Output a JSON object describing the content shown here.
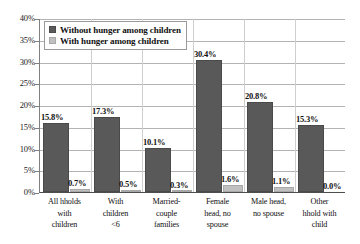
{
  "chart_data": {
    "type": "bar",
    "title": "",
    "subtitle": "",
    "xlabel": "",
    "ylabel": "",
    "ylim": [
      0,
      40
    ],
    "ytick_labels": [
      "0%",
      "5%",
      "10%",
      "15%",
      "20%",
      "25%",
      "30%",
      "35%",
      "40%"
    ],
    "ytick_values": [
      0,
      5,
      10,
      15,
      20,
      25,
      30,
      35,
      40
    ],
    "grid": "horizontal",
    "legend_position": "top-left",
    "categories": [
      "All hholds\nwith\nchildren",
      "With\nchildren\n<6",
      "Married-\ncouple\nfamilies",
      "Female\nhead, no\nspouse",
      "Male head,\nno spouse",
      "Other\nhhold with\nchild"
    ],
    "series": [
      {
        "name": "Without hunger among children",
        "color": "#595959",
        "values": [
          15.8,
          17.3,
          10.1,
          30.4,
          20.8,
          15.3
        ],
        "labels": [
          "15.8%",
          "17.3%",
          "10.1%",
          "30.4%",
          "20.8%",
          "15.3%"
        ]
      },
      {
        "name": "With hunger among children",
        "color": "#c0c0c0",
        "values": [
          0.7,
          0.5,
          0.3,
          1.6,
          1.1,
          0.0
        ],
        "labels": [
          "0.7%",
          "0.5%",
          "0.3%",
          "1.6%",
          "1.1%",
          "0.0%"
        ]
      }
    ]
  },
  "legend": {
    "items": [
      {
        "label": "Without hunger among children",
        "swatch": "dark-swatch"
      },
      {
        "label": "With hunger among children",
        "swatch": "light-swatch"
      }
    ]
  }
}
